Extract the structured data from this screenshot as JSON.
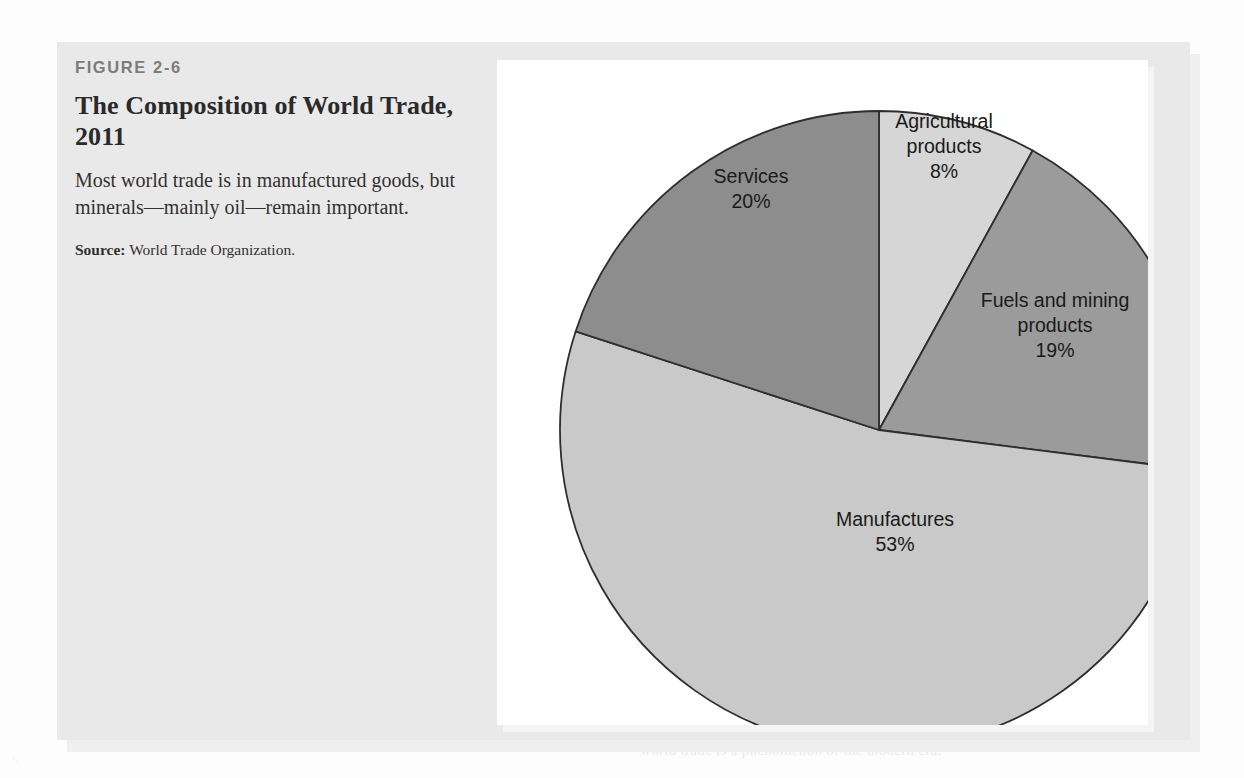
{
  "figure": {
    "number": "FIGURE 2-6",
    "title": "The Composition of World Trade, 2011",
    "description": "Most world trade is in manufactured goods, but minerals—mainly oil—remain important.",
    "source_label": "Source:",
    "source_text": "World Trade Organization."
  },
  "background_ghost_text": {
    "line1": "and the development of trade following World War II, and in",
    "line2": "the 1970s and 1980s.",
    "line3": "Manufactures and Services",
    "line4": "the sharp growth in trade of manufactured goods between nations, as",
    "line5": "shown in the figure, with manufactures being by far the largest single",
    "line6": "category. World trade in 1900 rivals that of the 1970s period.",
    "line7": "world trade is a phenomenon of the modern era."
  },
  "colors": {
    "page_background": "#fdfdfd",
    "figure_box": "#e9e9e9",
    "chart_panel": "#ffffff",
    "slice_agricultural": "#d6d6d6",
    "slice_fuels": "#9b9b9b",
    "slice_manufactures": "#c9c9c9",
    "slice_services": "#8d8d8d",
    "slice_outline": "#2e2e2e",
    "label_text": "#1a1a1a",
    "title_text": "#2a2a2a",
    "figure_number_text": "#7c7c7c"
  },
  "chart_data": {
    "type": "pie",
    "title": "The Composition of World Trade, 2011",
    "unit": "%",
    "start_angle_deg": 0,
    "direction": "clockwise",
    "legend": "none",
    "categories": [
      "Agricultural products",
      "Fuels and mining products",
      "Manufactures",
      "Services"
    ],
    "values": [
      8,
      19,
      53,
      20
    ],
    "slices": [
      {
        "label": "Agricultural products",
        "value": 8,
        "value_label": "8%",
        "color": "#d6d6d6",
        "label_lines": [
          "Agricultural",
          "products",
          "8%"
        ]
      },
      {
        "label": "Fuels and mining products",
        "value": 19,
        "value_label": "19%",
        "color": "#9b9b9b",
        "label_lines": [
          "Fuels and mining",
          "products",
          "19%"
        ]
      },
      {
        "label": "Manufactures",
        "value": 53,
        "value_label": "53%",
        "color": "#c9c9c9",
        "label_lines": [
          "Manufactures",
          "53%"
        ]
      },
      {
        "label": "Services",
        "value": 20,
        "value_label": "20%",
        "color": "#8d8d8d",
        "label_lines": [
          "Services",
          "20%"
        ]
      }
    ]
  }
}
